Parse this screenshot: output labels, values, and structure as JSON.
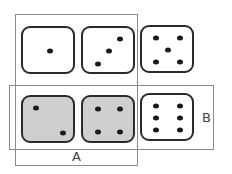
{
  "diagram": {
    "title": "",
    "sets": [
      {
        "name": "A",
        "label": "A",
        "x": 15,
        "y": 14,
        "w": 123,
        "h": 152
      },
      {
        "name": "B",
        "label": "B",
        "x": 9,
        "y": 85,
        "w": 205,
        "h": 65
      }
    ],
    "dice": [
      {
        "value": 1,
        "shaded": false,
        "x": 21,
        "y": 26,
        "pips": [
          [
            27,
            23
          ]
        ]
      },
      {
        "value": 3,
        "shaded": false,
        "x": 81,
        "y": 26,
        "pips": [
          [
            37,
            11
          ],
          [
            26,
            23
          ],
          [
            15,
            36
          ]
        ]
      },
      {
        "value": 5,
        "shaded": false,
        "x": 140,
        "y": 25,
        "pips": [
          [
            14,
            11
          ],
          [
            38,
            11
          ],
          [
            26,
            23
          ],
          [
            14,
            35
          ],
          [
            38,
            35
          ]
        ]
      },
      {
        "value": 2,
        "shaded": true,
        "x": 21,
        "y": 95,
        "pips": [
          [
            13,
            11
          ],
          [
            40,
            36
          ]
        ]
      },
      {
        "value": 4,
        "shaded": true,
        "x": 81,
        "y": 95,
        "pips": [
          [
            15,
            12
          ],
          [
            37,
            12
          ],
          [
            15,
            35
          ],
          [
            37,
            35
          ]
        ]
      },
      {
        "value": 6,
        "shaded": false,
        "x": 140,
        "y": 93,
        "pips": [
          [
            14,
            11
          ],
          [
            38,
            11
          ],
          [
            14,
            23
          ],
          [
            38,
            23
          ],
          [
            14,
            35
          ],
          [
            38,
            35
          ]
        ]
      }
    ],
    "colors": {
      "shaded_fill": "#cfcfcf",
      "outline": "#2a2a2a",
      "set_border": "#8a8a8a"
    }
  }
}
